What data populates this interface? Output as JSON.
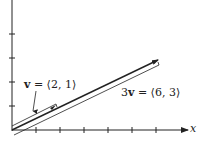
{
  "diagram": {
    "type": "vector-diagram",
    "axes": {
      "x_label": "x",
      "x_ticks": 6,
      "y_ticks": 4,
      "unit_px": 24
    },
    "vectors": [
      {
        "name": "v",
        "label_prefix": "v",
        "label_rest": " = ⟨2, 1⟩",
        "components": [
          2,
          1
        ]
      },
      {
        "name": "3v",
        "label_prefix_coef": "3",
        "label_prefix": "v",
        "label_rest": " = ⟨6, 3⟩",
        "components": [
          6,
          3
        ]
      }
    ],
    "colors": {
      "line": "#222222",
      "background": "#ffffff"
    }
  }
}
